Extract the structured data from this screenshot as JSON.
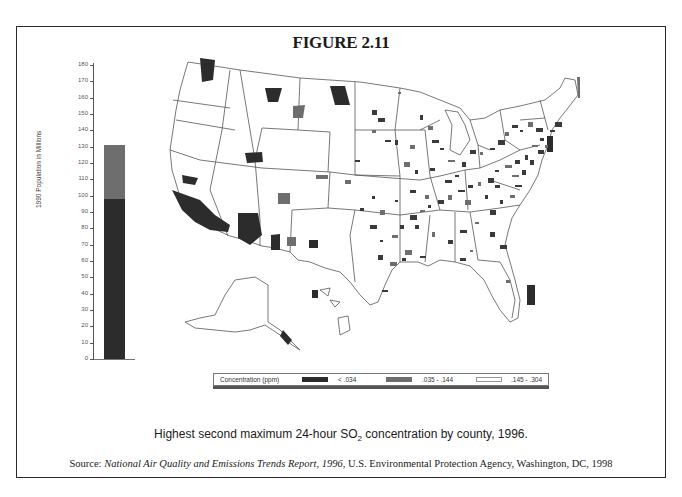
{
  "figure": {
    "title": "FIGURE 2.11",
    "caption_prefix": "Highest second maximum 24-hour SO",
    "caption_sub": "2",
    "caption_suffix": " concentration by county, 1996.",
    "source_label": "Source: ",
    "source_title": "National Air Quality and Emissions Trends Report, 1996",
    "source_rest": ", U.S. Environmental Protection Agency, Washington, DC, 1998"
  },
  "legend": {
    "title": "Concentration (ppm)",
    "items": [
      {
        "label": "< .034",
        "color": "#2c2c2c"
      },
      {
        "label": ".035 - .144",
        "color": "#6e6e6e"
      },
      {
        "label": ".145 - .304",
        "color": "#ffffff"
      }
    ]
  },
  "colors": {
    "high_dark": "#2c2c2c",
    "mid_gray": "#6e6e6e",
    "outline": "#555555"
  },
  "chart_data": [
    {
      "type": "bar",
      "title": "1990 Population in Millions (living in counties by SO2 concentration class)",
      "xlabel": "",
      "ylabel": "1990 Population in Millions",
      "ylim": [
        0,
        180
      ],
      "yticks": [
        0,
        10,
        20,
        30,
        40,
        50,
        60,
        70,
        80,
        90,
        100,
        110,
        120,
        130,
        140,
        150,
        160,
        170,
        180
      ],
      "stacked": true,
      "categories": [
        "Population"
      ],
      "series": [
        {
          "name": "< .034",
          "values": [
            98
          ],
          "color": "#2c2c2c"
        },
        {
          "name": ".035 - .144",
          "values": [
            33
          ],
          "color": "#6e6e6e"
        },
        {
          "name": ".145 - .304",
          "values": [
            0
          ],
          "color": "#ffffff"
        }
      ],
      "total": 131,
      "grid": false
    },
    {
      "type": "heatmap",
      "title": "Highest second maximum 24-hour SO2 concentration by county, 1996",
      "description": "Choropleth map of U.S. counties (including Alaska and Hawaii) shaded by concentration class",
      "legend_title": "Concentration (ppm)",
      "classes": [
        "< .034",
        ".035 - .144",
        ".145 - .304"
      ]
    }
  ]
}
